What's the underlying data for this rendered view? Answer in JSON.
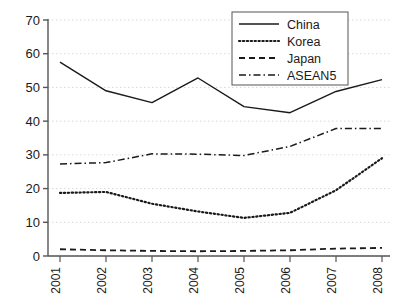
{
  "chart_data": {
    "type": "line",
    "title": "",
    "xlabel": "",
    "ylabel": "",
    "x": [
      "2001",
      "2002",
      "2003",
      "2004",
      "2005",
      "2006",
      "2007",
      "2008"
    ],
    "categories": [
      "2001",
      "2002",
      "2003",
      "2004",
      "2005",
      "2006",
      "2007",
      "2008"
    ],
    "xlim": [
      2001,
      2008
    ],
    "ylim": [
      0,
      70
    ],
    "yticks": [
      0,
      10,
      20,
      30,
      40,
      50,
      60,
      70
    ],
    "ytick_labels": [
      "0",
      "10",
      "20",
      "30",
      "40",
      "50",
      "60",
      "70"
    ],
    "xtick_labels": [
      "2001",
      "2002",
      "2003",
      "2004",
      "2005",
      "2006",
      "2007",
      "2008"
    ],
    "xtick_rotation": 90,
    "grid": true,
    "grid_axis": "y",
    "grid_style": "dotted",
    "legend_position": "top-right",
    "series": [
      {
        "name": "China",
        "style": "solid",
        "color": "#1a1a1a",
        "values": [
          57.5,
          49.0,
          45.5,
          52.8,
          44.3,
          42.5,
          48.8,
          52.3
        ]
      },
      {
        "name": "Korea",
        "style": "dotted",
        "color": "#1a1a1a",
        "values": [
          18.7,
          19.0,
          15.5,
          13.2,
          11.3,
          12.8,
          19.5,
          29.0
        ]
      },
      {
        "name": "Japan",
        "style": "dashed",
        "color": "#1a1a1a",
        "values": [
          2.0,
          1.7,
          1.5,
          1.4,
          1.5,
          1.7,
          2.2,
          2.4
        ]
      },
      {
        "name": "ASEAN5",
        "style": "dashdot",
        "color": "#1a1a1a",
        "values": [
          27.3,
          27.7,
          30.3,
          30.2,
          29.8,
          32.5,
          37.8,
          37.8
        ]
      }
    ]
  },
  "legend": {
    "items": [
      {
        "label": "China"
      },
      {
        "label": "Korea"
      },
      {
        "label": "Japan"
      },
      {
        "label": "ASEAN5"
      }
    ]
  },
  "colors": {
    "ink": "#1a1a1a",
    "axis": "#555555",
    "grid": "#d9d9d9",
    "background": "#ffffff"
  }
}
